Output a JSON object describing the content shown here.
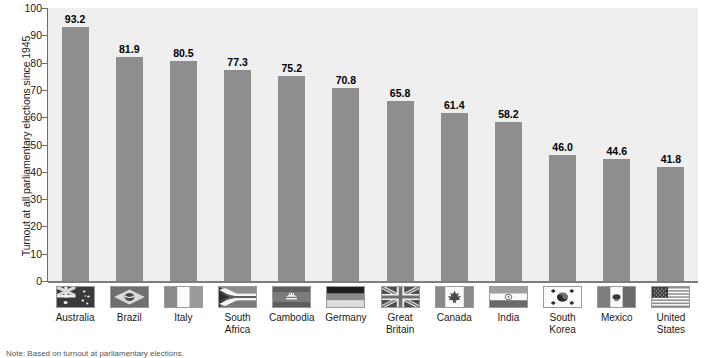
{
  "chart_data": {
    "type": "bar",
    "title": "",
    "subtitle": "",
    "xlabel": "",
    "ylabel": "Turnout at all parliamentary elections since 1945",
    "ylim": [
      0,
      100
    ],
    "yticks": [
      0,
      10,
      20,
      30,
      40,
      50,
      60,
      70,
      80,
      90,
      100
    ],
    "ytick_labels": [
      "0",
      "10",
      "20",
      "30",
      "40",
      "50",
      "60",
      "70",
      "80",
      "90",
      "100"
    ],
    "grid": false,
    "legend": "none",
    "orientation": "vertical",
    "categories": [
      "Australia",
      "Brazil",
      "Italy",
      "South Africa",
      "Cambodia",
      "Germany",
      "Great Britain",
      "Canada",
      "India",
      "South Korea",
      "Mexico",
      "United States"
    ],
    "category_lines": [
      [
        "Australia"
      ],
      [
        "Brazil"
      ],
      [
        "Italy"
      ],
      [
        "South",
        "Africa"
      ],
      [
        "Cambodia"
      ],
      [
        "Germany"
      ],
      [
        "Great",
        "Britain"
      ],
      [
        "Canada"
      ],
      [
        "India"
      ],
      [
        "South",
        "Korea"
      ],
      [
        "Mexico"
      ],
      [
        "United",
        "States"
      ]
    ],
    "values": [
      93.2,
      81.9,
      80.5,
      77.3,
      75.2,
      70.8,
      65.8,
      61.4,
      58.2,
      46.0,
      44.6,
      41.8
    ],
    "value_labels": [
      "93.2",
      "81.9",
      "80.5",
      "77.3",
      "75.2",
      "70.8",
      "65.8",
      "61.4",
      "58.2",
      "46.0",
      "44.6",
      "41.8"
    ],
    "flag_icons": [
      "flag-australia-icon",
      "flag-brazil-icon",
      "flag-italy-icon",
      "flag-south-africa-icon",
      "flag-cambodia-icon",
      "flag-germany-icon",
      "flag-great-britain-icon",
      "flag-canada-icon",
      "flag-india-icon",
      "flag-south-korea-icon",
      "flag-mexico-icon",
      "flag-united-states-icon"
    ],
    "colors": {
      "bar": "#8e8e8e",
      "plot_background": "#efefef",
      "page_background": "#ffffff",
      "axis": "#6d6d6d",
      "baseline": "#7d7d7d",
      "text": "#1a1a1a"
    }
  },
  "note": {
    "text": "Note: Based on turnout at parliamentary elections."
  }
}
